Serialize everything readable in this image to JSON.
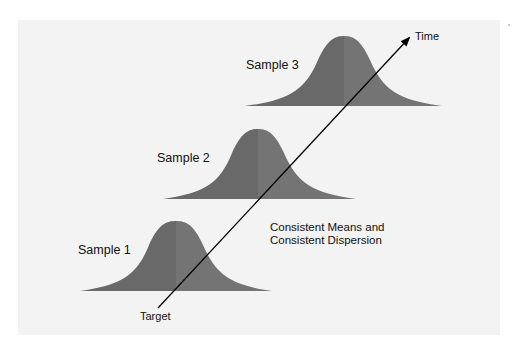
{
  "diagram": {
    "samples": [
      {
        "label": "Sample 1"
      },
      {
        "label": "Sample 2"
      },
      {
        "label": "Sample 3"
      }
    ],
    "axis": {
      "start_label": "Target",
      "end_label": "Time"
    },
    "annotation": {
      "line1": "Consistent Means and",
      "line2": "Consistent Dispersion"
    },
    "colors": {
      "background": "#f3f3f3",
      "curve_left": "#6a6a6a",
      "curve_right": "#737373",
      "arrow": "#000000"
    }
  }
}
